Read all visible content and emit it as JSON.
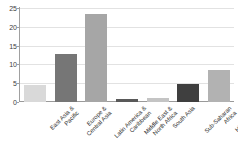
{
  "chart_data": {
    "type": "bar",
    "title": "",
    "subtitle": "",
    "xlabel": "",
    "ylabel": "",
    "ylim": [
      0,
      25
    ],
    "yticks": [
      0,
      5,
      10,
      15,
      20,
      25
    ],
    "grid": true,
    "legend": "none",
    "categories": [
      "East Asia & Pacific",
      "Europe & Central Asia",
      "Latin America & Caribbean",
      "Middle East & North Africa",
      "South Asia",
      "Sub-Saharan Africa",
      "High-income"
    ],
    "category_lines": [
      [
        "East Asia &",
        "Pacific"
      ],
      [
        "Europe &",
        "Central Asia"
      ],
      [
        "Latin America &",
        "Caribbean"
      ],
      [
        "Middle East &",
        "North Africa"
      ],
      [
        "South Asia"
      ],
      [
        "Sub-Saharan",
        "Africa"
      ],
      [
        "High-income"
      ]
    ],
    "values": [
      4.5,
      12.8,
      23.5,
      0.7,
      1.2,
      4.8,
      8.4
    ],
    "bar_colors": [
      "#d9d9d9",
      "#767676",
      "#a6a6a6",
      "#595959",
      "#c4c4c4",
      "#3f3f3f",
      "#b2b2b2"
    ]
  },
  "axis": {
    "tick_label_color": "#3d3d3d",
    "axis_line_color": "#a0a0a0",
    "gridline_color": "#e2e2e2"
  }
}
